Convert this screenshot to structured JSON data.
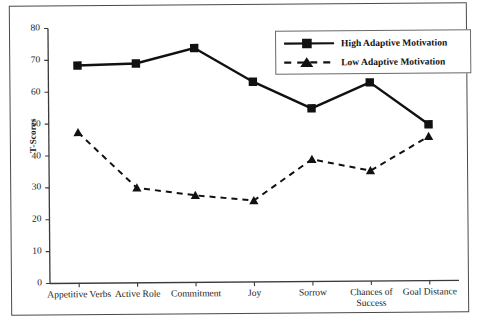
{
  "figure": {
    "ylabel": "T-Scores",
    "legend_title": "",
    "frame": true
  },
  "chart_data": {
    "type": "line",
    "title": "",
    "xlabel": "",
    "ylabel": "T-Scores",
    "ylim": [
      0,
      80
    ],
    "yticks": [
      0,
      10,
      20,
      30,
      40,
      50,
      60,
      70,
      80
    ],
    "grid": false,
    "legend_position": "top-right",
    "categories": [
      "Appetitive Verbs",
      "Active Role",
      "Commitment",
      "Joy",
      "Sorrow",
      "Chances of Success",
      "Goal Distance"
    ],
    "series": [
      {
        "name": "High Adaptive Motivation",
        "marker": "square",
        "linestyle": "solid",
        "color": "#111111",
        "values": [
          68.3,
          68.8,
          73.5,
          62.8,
          54.3,
          62.3,
          49.0
        ]
      },
      {
        "name": "Low Adaptive Motivation",
        "marker": "triangle",
        "linestyle": "dashed",
        "color": "#111111",
        "values": [
          47.3,
          29.8,
          27.3,
          25.5,
          38.3,
          34.6,
          45.2
        ]
      }
    ]
  }
}
